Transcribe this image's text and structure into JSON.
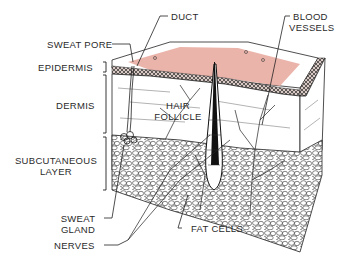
{
  "colors": {
    "skin_surface": "#e8a79c",
    "ink": "#1e1e1e",
    "background": "#ffffff"
  },
  "labels": {
    "duct": "DUCT",
    "blood_vessels_1": "BLOOD",
    "blood_vessels_2": "VESSELS",
    "sweat_pore": "SWEAT PORE",
    "epidermis": "EPIDERMIS",
    "dermis": "DERMIS",
    "hair_follicle_1": "HAIR",
    "hair_follicle_2": "FOLLICLE",
    "subcutaneous_1": "SUBCUTANEOUS",
    "subcutaneous_2": "LAYER",
    "sweat_gland_1": "SWEAT",
    "sweat_gland_2": "GLAND",
    "nerves": "NERVES",
    "fat_cells": "FAT CELLS"
  },
  "layers": [
    {
      "name": "Epidermis",
      "bracket": [
        62,
        72
      ]
    },
    {
      "name": "Dermis",
      "bracket": [
        75,
        133
      ]
    },
    {
      "name": "Subcutaneous Layer",
      "bracket": [
        137,
        190
      ]
    }
  ]
}
